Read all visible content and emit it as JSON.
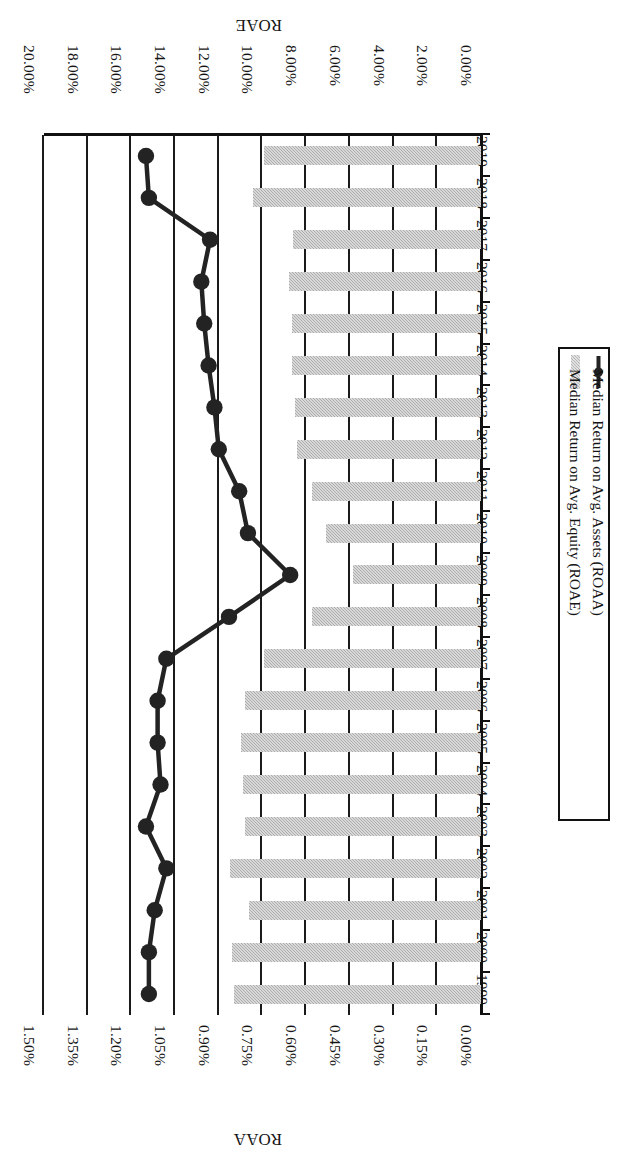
{
  "chart_data": {
    "type": "bar",
    "title": "",
    "orientation": "horizontal",
    "rotated_180": true,
    "categories": [
      "1999",
      "2000",
      "2001",
      "2002",
      "2003",
      "2004",
      "2005",
      "2006",
      "2007",
      "2008",
      "2009",
      "2010",
      "2011",
      "2012",
      "2013",
      "2014",
      "2015",
      "2016",
      "2017",
      "2018",
      "2019"
    ],
    "xlabel": "",
    "ylabel": "ROAE",
    "secondary_ylabel": "ROAA",
    "ylim": [
      0,
      20
    ],
    "secondary_ylim": [
      0,
      1.5
    ],
    "grid": true,
    "legend_position": "right",
    "series": [
      {
        "name": "Median Return on Avg. Equity (ROAE)",
        "type": "bar",
        "axis": "primary",
        "unit": "%",
        "color": "#b9b9b9",
        "values": [
          11.3,
          11.4,
          10.6,
          11.5,
          10.8,
          10.9,
          11.0,
          10.8,
          9.95,
          7.75,
          5.85,
          7.1,
          7.75,
          8.4,
          8.5,
          8.65,
          8.65,
          8.8,
          8.6,
          10.45,
          9.95
        ]
      },
      {
        "name": "Median Return on Avg. Assets (ROAA)",
        "type": "line",
        "axis": "secondary",
        "unit": "%",
        "color": "#232323",
        "values": [
          1.14,
          1.14,
          1.12,
          1.08,
          1.15,
          1.1,
          1.11,
          1.11,
          1.08,
          0.865,
          0.655,
          0.8,
          0.83,
          0.9,
          0.915,
          0.935,
          0.95,
          0.96,
          0.93,
          1.14,
          1.15
        ]
      }
    ],
    "primary_ticks": [
      "0.00%",
      "2.00%",
      "4.00%",
      "6.00%",
      "8.00%",
      "10.00%",
      "12.00%",
      "14.00%",
      "16.00%",
      "18.00%",
      "20.00%"
    ],
    "secondary_ticks": [
      "0.00%",
      "0.15%",
      "0.30%",
      "0.45%",
      "0.60%",
      "0.75%",
      "0.90%",
      "1.05%",
      "1.20%",
      "1.35%",
      "1.50%"
    ]
  },
  "axes": {
    "primary_title": "ROAE",
    "secondary_title": "ROAA"
  },
  "legend": {
    "entries": [
      {
        "label": "Median Return on Avg. Equity (ROAE)",
        "marker": "bar-swatch"
      },
      {
        "label": "Median Return on Avg. Assets (ROAA)",
        "marker": "line-marker-swatch"
      }
    ]
  },
  "colors": {
    "bar": "#b9b9b9",
    "line": "#232323",
    "axis": "#111111",
    "background": "#ffffff"
  }
}
